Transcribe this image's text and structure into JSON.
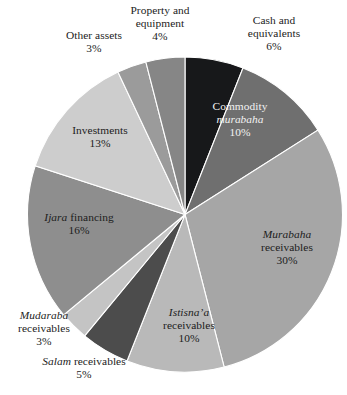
{
  "chart_data": {
    "type": "pie",
    "title": "",
    "subtitle": "",
    "xlabel": "",
    "ylabel": "",
    "legend_position": "none",
    "grid": false,
    "start_angle_deg": 0,
    "direction": "clockwise",
    "units": "percent",
    "categories": [
      "Cash and equivalents",
      "Commodity murabaha",
      "Murabaha receivables",
      "Istisna'a receivables",
      "Salam receivables",
      "Mudaraba receivables",
      "Ijara financing",
      "Investments",
      "Other assets",
      "Property and equipment"
    ],
    "values": [
      6,
      10,
      30,
      10,
      5,
      3,
      16,
      13,
      3,
      4
    ],
    "slices": [
      {
        "key": "cash",
        "name_plain": "Cash and",
        "name_line2": "equivalents",
        "italic_word": "",
        "percent_label": "6%",
        "value": 6,
        "color": "#17181a",
        "label_placement": "outside",
        "label_color": "#1c1c1c"
      },
      {
        "key": "commodity-murabaha",
        "name_plain": "Commodity",
        "name_line2": "murabaha",
        "italic_word": "murabaha",
        "percent_label": "10%",
        "value": 10,
        "color": "#6f6f6f",
        "label_placement": "inside",
        "label_color": "#f2f2f2"
      },
      {
        "key": "murabaha-receivables",
        "name_plain": "Murabaha",
        "name_line2": "receivables",
        "italic_word": "Murabaha",
        "percent_label": "30%",
        "value": 30,
        "color": "#a6a6a6",
        "label_placement": "inside",
        "label_color": "#1c1c1c"
      },
      {
        "key": "istisnaa-receivables",
        "name_plain": "Istisna'a",
        "name_line2": "receivables",
        "italic_word": "Istisna'a",
        "percent_label": "10%",
        "value": 10,
        "color": "#b9b9b9",
        "label_placement": "inside",
        "label_color": "#1c1c1c"
      },
      {
        "key": "salam-receivables",
        "name_plain": "Salam",
        "name_line2": "receivables",
        "italic_word": "Salam",
        "percent_label": "5%",
        "value": 5,
        "color": "#4c4c4c",
        "label_placement": "outside",
        "label_color": "#1c1c1c"
      },
      {
        "key": "mudaraba-receivables",
        "name_plain": "Mudaraba",
        "name_line2": "receivables",
        "italic_word": "Mudaraba",
        "percent_label": "3%",
        "value": 3,
        "color": "#c4c4c4",
        "label_placement": "outside",
        "label_color": "#1c1c1c"
      },
      {
        "key": "ijara-financing",
        "name_plain": "Ijara",
        "name_line2": "financing",
        "italic_word": "Ijara",
        "percent_label": "16%",
        "value": 16,
        "color": "#8e8e8e",
        "label_placement": "inside",
        "label_color": "#1c1c1c"
      },
      {
        "key": "investments",
        "name_plain": "Investments",
        "name_line2": "",
        "italic_word": "",
        "percent_label": "13%",
        "value": 13,
        "color": "#cdcdcd",
        "label_placement": "inside",
        "label_color": "#1c1c1c"
      },
      {
        "key": "other-assets",
        "name_plain": "Other assets",
        "name_line2": "",
        "italic_word": "",
        "percent_label": "3%",
        "value": 3,
        "color": "#9b9b9b",
        "label_placement": "outside",
        "label_color": "#1c1c1c"
      },
      {
        "key": "property-equipment",
        "name_plain": "Property and",
        "name_line2": "equipment",
        "italic_word": "",
        "percent_label": "4%",
        "value": 4,
        "color": "#868686",
        "label_placement": "outside",
        "label_color": "#1c1c1c"
      }
    ]
  },
  "labels": {
    "property": {
      "line1": "Property and",
      "line2": "equipment",
      "pct": "4%"
    },
    "cash": {
      "line1": "Cash and",
      "line2": "equivalents",
      "pct": "6%"
    },
    "other_assets": {
      "line1": "Other assets",
      "pct": "3%"
    },
    "investments": {
      "line1": "Investments",
      "pct": "13%"
    },
    "commodity": {
      "line1": "Commodity",
      "line2": "murabaha",
      "pct": "10%"
    },
    "murabaha": {
      "line1": "Murabaha",
      "line2": "receivables",
      "pct": "30%"
    },
    "ijara": {
      "line1": "Ijara",
      "line2": "financing",
      "pct": "16%"
    },
    "istisnaa": {
      "line1": "Istisna’a",
      "line2": "receivables",
      "pct": "10%"
    },
    "mudaraba": {
      "line1": "Mudaraba",
      "line2": "receivables",
      "pct": "3%"
    },
    "salam": {
      "line1": "Salam",
      "line2": "receivables",
      "pct": "5%"
    }
  },
  "colors": {
    "background": "#ffffff",
    "text": "#1c1c1c",
    "text_on_dark": "#f2f2f2"
  }
}
